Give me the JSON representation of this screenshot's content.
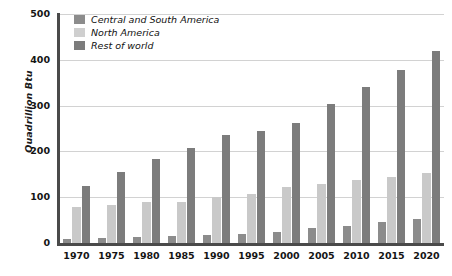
{
  "chart_data": {
    "type": "bar",
    "title": "",
    "xlabel": "",
    "ylabel": "Quadrillion Btu",
    "ylim": [
      0,
      500
    ],
    "yticks": [
      0,
      100,
      200,
      300,
      400,
      500
    ],
    "grid": "horizontal",
    "legend_position": "top-left-inside",
    "categories": [
      "1970",
      "1975",
      "1980",
      "1985",
      "1990",
      "1995",
      "2000",
      "2005",
      "2010",
      "2015",
      "2020"
    ],
    "series": [
      {
        "name": "Central and South America",
        "color": "#8c8c8c",
        "values": [
          8,
          10,
          13,
          15,
          17,
          20,
          25,
          33,
          38,
          45,
          52
        ]
      },
      {
        "name": "North America",
        "color": "#c9c9c9",
        "values": [
          78,
          82,
          90,
          90,
          100,
          108,
          122,
          128,
          138,
          145,
          152
        ]
      },
      {
        "name": "Rest of world",
        "color": "#7c7c7c",
        "values": [
          125,
          155,
          183,
          208,
          235,
          245,
          263,
          303,
          340,
          378,
          420
        ]
      }
    ]
  },
  "legend": {
    "items": [
      {
        "label": "Central and South America"
      },
      {
        "label": "North America"
      },
      {
        "label": "Rest of world"
      }
    ]
  },
  "axes": {
    "y_title": "Quadrillion Btu",
    "y_ticks": [
      "500",
      "400",
      "300",
      "200",
      "100",
      "0"
    ]
  }
}
